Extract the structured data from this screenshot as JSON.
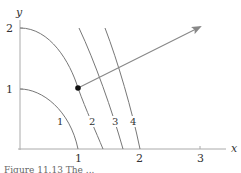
{
  "axes": {
    "x_label": "x",
    "y_label": "y",
    "x_ticks": [
      "1",
      "2",
      "3"
    ],
    "y_ticks": [
      "1",
      "2"
    ]
  },
  "curves": [
    {
      "label": "1"
    },
    {
      "label": "2"
    },
    {
      "label": "3"
    },
    {
      "label": "4"
    }
  ],
  "point": {
    "description": "marked point on curve 2 at about (1, 1)"
  },
  "arrow": {
    "description": "gradient arrow from marked point pointing up-right"
  },
  "caption": "Figure 11.13  The ..."
}
